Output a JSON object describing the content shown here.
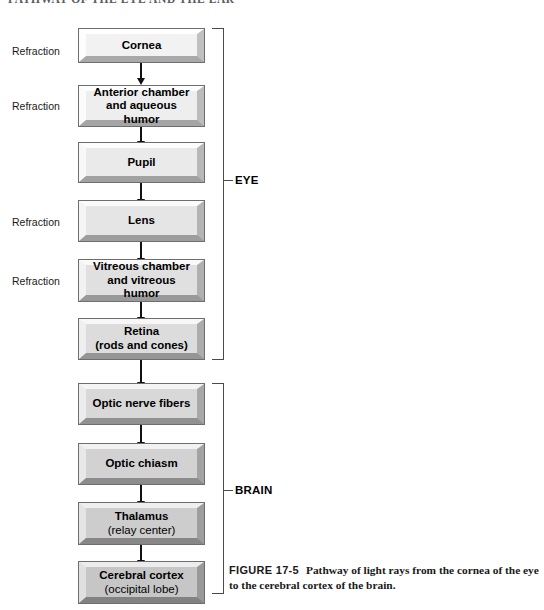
{
  "page": {
    "header_text": "PATHWAY OF THE EYE AND THE EAR"
  },
  "flowchart": {
    "title": "Pathway of light rays",
    "boxes": [
      {
        "line1": "Cornea",
        "line2": "",
        "refraction": "Refraction",
        "group": "EYE"
      },
      {
        "line1": "Anterior chamber",
        "line2": "and aqueous humor",
        "refraction": "Refraction",
        "group": "EYE"
      },
      {
        "line1": "Pupil",
        "line2": "",
        "refraction": "",
        "group": "EYE"
      },
      {
        "line1": "Lens",
        "line2": "",
        "refraction": "Refraction",
        "group": "EYE"
      },
      {
        "line1": "Vitreous chamber",
        "line2": "and vitreous humor",
        "refraction": "Refraction",
        "group": "EYE"
      },
      {
        "line1": "Retina",
        "line2": "(rods and cones)",
        "refraction": "",
        "group": "EYE"
      },
      {
        "line1": "Optic nerve fibers",
        "line2": "",
        "refraction": "",
        "group": "BRAIN"
      },
      {
        "line1": "Optic chiasm",
        "line2": "",
        "refraction": "",
        "group": "BRAIN"
      },
      {
        "line1": "Thalamus",
        "line2": "(relay center)",
        "refraction": "",
        "group": "BRAIN"
      },
      {
        "line1": "Cerebral cortex",
        "line2": "(occipital lobe)",
        "refraction": "",
        "group": "BRAIN"
      }
    ],
    "groups": [
      {
        "label": "EYE",
        "first_box": 0,
        "last_box": 5
      },
      {
        "label": "BRAIN",
        "first_box": 6,
        "last_box": 9
      }
    ]
  },
  "caption": {
    "figure_number": "FIGURE 17-5",
    "text": "Pathway of light rays from the cornea of the eye to the cerebral cortex of the brain."
  },
  "colors": {
    "box_border": "#6e6e6e",
    "arrow": "#111111",
    "bracket": "#4a4a4a",
    "text": "#000000"
  }
}
